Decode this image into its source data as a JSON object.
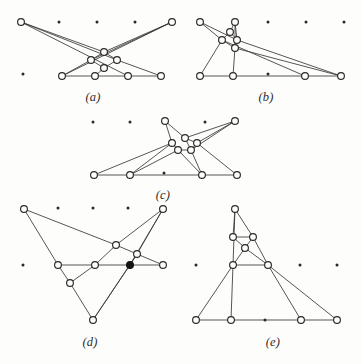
{
  "page": {
    "width": 362,
    "height": 364,
    "background_color": "#fdfdfc",
    "ink_color": "#2b2825",
    "edge_color": "#3a3734"
  },
  "captions": {
    "a": "(a)",
    "b": "(b)",
    "c": "(c)",
    "d": "(d)",
    "e": "(e)"
  },
  "figures": [
    {
      "id": "a",
      "caption": "(a)",
      "caption_x": 93,
      "caption_y": 90,
      "grid_dots": [
        [
          59,
          22
        ],
        [
          97,
          22
        ],
        [
          135,
          22
        ],
        [
          23,
          74
        ]
      ],
      "nodes": [
        {
          "id": "a1",
          "x": 21,
          "y": 22,
          "filled": false
        },
        {
          "id": "a2",
          "x": 172,
          "y": 22,
          "filled": false
        },
        {
          "id": "a3",
          "x": 104,
          "y": 52,
          "filled": false
        },
        {
          "id": "a4",
          "x": 91,
          "y": 60,
          "filled": false
        },
        {
          "id": "a5",
          "x": 117,
          "y": 60,
          "filled": false
        },
        {
          "id": "a6",
          "x": 104,
          "y": 68,
          "filled": false
        },
        {
          "id": "a7",
          "x": 62,
          "y": 76,
          "filled": false
        },
        {
          "id": "a8",
          "x": 95,
          "y": 76,
          "filled": false
        },
        {
          "id": "a9",
          "x": 128,
          "y": 76,
          "filled": false
        },
        {
          "id": "a10",
          "x": 161,
          "y": 76,
          "filled": false
        }
      ],
      "edges": [
        [
          "a1",
          "a5"
        ],
        [
          "a1",
          "a9"
        ],
        [
          "a1",
          "a3"
        ],
        [
          "a2",
          "a4"
        ],
        [
          "a2",
          "a7"
        ],
        [
          "a2",
          "a3"
        ],
        [
          "a3",
          "a4"
        ],
        [
          "a3",
          "a5"
        ],
        [
          "a4",
          "a6"
        ],
        [
          "a5",
          "a6"
        ],
        [
          "a4",
          "a7"
        ],
        [
          "a5",
          "a10"
        ],
        [
          "a6",
          "a8"
        ],
        [
          "a7",
          "a8"
        ],
        [
          "a8",
          "a9"
        ],
        [
          "a9",
          "a10"
        ]
      ]
    },
    {
      "id": "b",
      "caption": "(b)",
      "caption_x": 266,
      "caption_y": 90,
      "grid_dots": [
        [
          268,
          22
        ],
        [
          306,
          22
        ],
        [
          344,
          22
        ],
        [
          268,
          74
        ]
      ],
      "nodes": [
        {
          "id": "b1",
          "x": 200,
          "y": 22,
          "filled": false
        },
        {
          "id": "b2",
          "x": 235,
          "y": 22,
          "filled": false
        },
        {
          "id": "b3",
          "x": 230,
          "y": 32,
          "filled": false
        },
        {
          "id": "b4",
          "x": 222,
          "y": 40,
          "filled": false
        },
        {
          "id": "b5",
          "x": 237,
          "y": 40,
          "filled": false
        },
        {
          "id": "b6",
          "x": 235,
          "y": 48,
          "filled": false
        },
        {
          "id": "b7",
          "x": 200,
          "y": 76,
          "filled": false
        },
        {
          "id": "b8",
          "x": 233,
          "y": 76,
          "filled": false
        },
        {
          "id": "b9",
          "x": 305,
          "y": 76,
          "filled": false
        },
        {
          "id": "b10",
          "x": 341,
          "y": 76,
          "filled": false
        }
      ],
      "edges": [
        [
          "b1",
          "b4"
        ],
        [
          "b1",
          "b5"
        ],
        [
          "b2",
          "b3"
        ],
        [
          "b2",
          "b5"
        ],
        [
          "b2",
          "b6"
        ],
        [
          "b3",
          "b4"
        ],
        [
          "b3",
          "b5"
        ],
        [
          "b4",
          "b6"
        ],
        [
          "b5",
          "b6"
        ],
        [
          "b4",
          "b7"
        ],
        [
          "b4",
          "b9"
        ],
        [
          "b6",
          "b8"
        ],
        [
          "b6",
          "b10"
        ],
        [
          "b5",
          "b10"
        ],
        [
          "b7",
          "b8"
        ],
        [
          "b8",
          "b9"
        ],
        [
          "b9",
          "b10"
        ]
      ]
    },
    {
      "id": "c",
      "caption": "(c)",
      "caption_x": 163,
      "caption_y": 188,
      "grid_dots": [
        [
          93,
          122
        ],
        [
          130,
          122
        ],
        [
          205,
          122
        ],
        [
          164,
          173
        ]
      ],
      "nodes": [
        {
          "id": "c1",
          "x": 165,
          "y": 121,
          "filled": false
        },
        {
          "id": "c2",
          "x": 235,
          "y": 121,
          "filled": false
        },
        {
          "id": "c3",
          "x": 185,
          "y": 138,
          "filled": false
        },
        {
          "id": "c4",
          "x": 172,
          "y": 143,
          "filled": false
        },
        {
          "id": "c5",
          "x": 197,
          "y": 143,
          "filled": false
        },
        {
          "id": "c6",
          "x": 178,
          "y": 150,
          "filled": false
        },
        {
          "id": "c7",
          "x": 191,
          "y": 150,
          "filled": false
        },
        {
          "id": "c8",
          "x": 94,
          "y": 175,
          "filled": false
        },
        {
          "id": "c9",
          "x": 130,
          "y": 175,
          "filled": false
        },
        {
          "id": "c10",
          "x": 202,
          "y": 175,
          "filled": false
        },
        {
          "id": "c11",
          "x": 237,
          "y": 175,
          "filled": false
        }
      ],
      "edges": [
        [
          "c1",
          "c4"
        ],
        [
          "c1",
          "c3"
        ],
        [
          "c2",
          "c3"
        ],
        [
          "c2",
          "c5"
        ],
        [
          "c2",
          "c7"
        ],
        [
          "c3",
          "c5"
        ],
        [
          "c3",
          "c7"
        ],
        [
          "c4",
          "c6"
        ],
        [
          "c5",
          "c7"
        ],
        [
          "c6",
          "c7"
        ],
        [
          "c4",
          "c8"
        ],
        [
          "c6",
          "c9"
        ],
        [
          "c7",
          "c10"
        ],
        [
          "c5",
          "c11"
        ],
        [
          "c6",
          "c10"
        ],
        [
          "c4",
          "c9"
        ],
        [
          "c8",
          "c9"
        ],
        [
          "c9",
          "c10"
        ],
        [
          "c10",
          "c11"
        ]
      ]
    },
    {
      "id": "d",
      "caption": "(d)",
      "caption_x": 90,
      "caption_y": 335,
      "grid_dots": [
        [
          58,
          208
        ],
        [
          93,
          208
        ],
        [
          128,
          208
        ],
        [
          23,
          265
        ]
      ],
      "nodes": [
        {
          "id": "d1",
          "x": 24,
          "y": 209,
          "filled": false
        },
        {
          "id": "d2",
          "x": 163,
          "y": 209,
          "filled": false
        },
        {
          "id": "d3",
          "x": 116,
          "y": 245,
          "filled": false
        },
        {
          "id": "d4",
          "x": 137,
          "y": 254,
          "filled": false
        },
        {
          "id": "d5",
          "x": 58,
          "y": 265,
          "filled": false
        },
        {
          "id": "d6",
          "x": 95,
          "y": 265,
          "filled": false
        },
        {
          "id": "d7",
          "x": 130,
          "y": 265,
          "filled": true
        },
        {
          "id": "d8",
          "x": 163,
          "y": 265,
          "filled": false
        },
        {
          "id": "d9",
          "x": 70,
          "y": 283,
          "filled": false
        },
        {
          "id": "d10",
          "x": 93,
          "y": 320,
          "filled": false
        }
      ],
      "edges": [
        [
          "d1",
          "d3"
        ],
        [
          "d1",
          "d5"
        ],
        [
          "d2",
          "d3"
        ],
        [
          "d2",
          "d4"
        ],
        [
          "d2",
          "d7"
        ],
        [
          "d3",
          "d4"
        ],
        [
          "d3",
          "d6"
        ],
        [
          "d4",
          "d8"
        ],
        [
          "d4",
          "d7"
        ],
        [
          "d5",
          "d6"
        ],
        [
          "d6",
          "d7"
        ],
        [
          "d7",
          "d8"
        ],
        [
          "d5",
          "d9"
        ],
        [
          "d9",
          "d10"
        ],
        [
          "d6",
          "d9"
        ],
        [
          "d10",
          "d7"
        ],
        [
          "d10",
          "d4"
        ]
      ]
    },
    {
      "id": "e",
      "caption": "(e)",
      "caption_x": 273,
      "caption_y": 335,
      "grid_dots": [
        [
          196,
          265
        ],
        [
          300,
          265
        ],
        [
          337,
          265
        ],
        [
          265,
          320
        ]
      ],
      "nodes": [
        {
          "id": "e1",
          "x": 235,
          "y": 209,
          "filled": false
        },
        {
          "id": "e2",
          "x": 233,
          "y": 237,
          "filled": false
        },
        {
          "id": "e3",
          "x": 253,
          "y": 237,
          "filled": false
        },
        {
          "id": "e4",
          "x": 245,
          "y": 248,
          "filled": false
        },
        {
          "id": "e5",
          "x": 233,
          "y": 265,
          "filled": false
        },
        {
          "id": "e6",
          "x": 268,
          "y": 265,
          "filled": false
        },
        {
          "id": "e7",
          "x": 196,
          "y": 320,
          "filled": false
        },
        {
          "id": "e8",
          "x": 231,
          "y": 320,
          "filled": false
        },
        {
          "id": "e9",
          "x": 301,
          "y": 320,
          "filled": false
        },
        {
          "id": "e10",
          "x": 337,
          "y": 320,
          "filled": false
        }
      ],
      "edges": [
        [
          "e1",
          "e2"
        ],
        [
          "e1",
          "e3"
        ],
        [
          "e1",
          "e5"
        ],
        [
          "e2",
          "e4"
        ],
        [
          "e3",
          "e4"
        ],
        [
          "e2",
          "e3"
        ],
        [
          "e3",
          "e6"
        ],
        [
          "e4",
          "e5"
        ],
        [
          "e4",
          "e6"
        ],
        [
          "e5",
          "e6"
        ],
        [
          "e5",
          "e7"
        ],
        [
          "e5",
          "e8"
        ],
        [
          "e6",
          "e9"
        ],
        [
          "e6",
          "e10"
        ],
        [
          "e7",
          "e8"
        ],
        [
          "e8",
          "e9"
        ],
        [
          "e9",
          "e10"
        ]
      ]
    }
  ],
  "style": {
    "node_radius": 3.4,
    "grid_dot_radius": 1.5
  }
}
